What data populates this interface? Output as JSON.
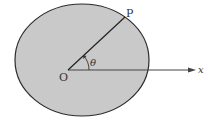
{
  "diagram": {
    "labels": {
      "point": "P",
      "origin": "O",
      "angle": "θ",
      "axis": "x"
    },
    "colors": {
      "fill": "#c9c9c9",
      "stroke": "#2a2a2a",
      "axis": "#555555"
    },
    "ellipse": {
      "cx": 82,
      "cy": 60,
      "rx": 67,
      "ry": 56
    },
    "origin_point": {
      "x": 68,
      "y": 70
    },
    "p_point": {
      "x": 125,
      "y": 17
    }
  }
}
